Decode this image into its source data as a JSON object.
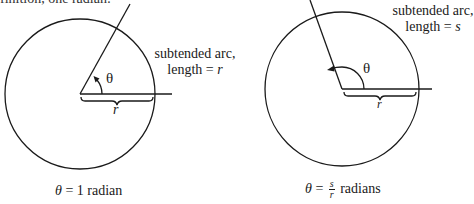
{
  "header_fragment": "finition, one radian:",
  "diagrams": [
    {
      "id": "one-radian",
      "arc_label": {
        "line1": "subtended arc,",
        "line2_prefix": "length = ",
        "line2_var": "r"
      },
      "angle_symbol": "θ",
      "radius_label": "r",
      "caption": {
        "lhs": "θ",
        "rhs": "= 1 radian"
      },
      "geometry": {
        "cx": 80,
        "cy": 94,
        "radius": 75,
        "ray_end": [
          130,
          4
        ],
        "baseline_end": [
          172,
          94
        ]
      }
    },
    {
      "id": "s-over-r-radians",
      "arc_label": {
        "line1": "subtended arc,",
        "line2_prefix": "length = ",
        "line2_var": "s"
      },
      "angle_symbol": "θ",
      "radius_label": "r",
      "caption": {
        "lhs": "θ",
        "eq": "=",
        "frac_num": "s",
        "frac_den": "r",
        "rhs": "radians"
      },
      "geometry": {
        "cx": 342,
        "cy": 89,
        "radius": 77,
        "ray_end": [
          310,
          0
        ],
        "baseline_end": [
          432,
          89
        ]
      }
    }
  ],
  "colors": {
    "stroke": "#1a1a1a",
    "background": "#ffffff"
  }
}
